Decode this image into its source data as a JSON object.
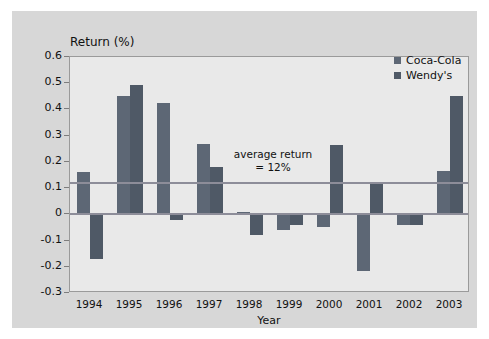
{
  "chart_data": {
    "type": "bar",
    "title": "",
    "ylabel": "Return (%)",
    "xlabel": "Year",
    "categories": [
      "1994",
      "1995",
      "1996",
      "1997",
      "1998",
      "1999",
      "2000",
      "2001",
      "2002",
      "2003"
    ],
    "ylim": [
      -0.3,
      0.6
    ],
    "ytick_labels": [
      "0.6",
      "0.5",
      "0.4",
      "0.3",
      "0.2",
      "0.1",
      "0",
      "-0.1",
      "-0.2",
      "-0.3"
    ],
    "ytick_values": [
      0.6,
      0.5,
      0.4,
      0.3,
      0.2,
      0.1,
      0,
      -0.1,
      -0.2,
      -0.3
    ],
    "grid": false,
    "legend_position": "top-right",
    "series": [
      {
        "name": "Coca-Cola",
        "color": "#5d6775",
        "values": [
          0.16,
          0.45,
          0.425,
          0.27,
          0.01,
          -0.06,
          -0.05,
          -0.215,
          -0.04,
          0.165
        ]
      },
      {
        "name": "Wendy's",
        "color": "#4f5966",
        "values": [
          -0.17,
          0.495,
          -0.02,
          0.18,
          -0.08,
          -0.04,
          0.265,
          0.12,
          -0.04,
          0.45
        ]
      }
    ],
    "annotations": [
      {
        "name": "average-return",
        "line1": "average return",
        "line2": "= 12%",
        "value": 0.12
      }
    ],
    "reference_line": {
      "label": "average return = 12%",
      "value": 0.12,
      "color": "#8d8d99"
    },
    "zero_line": {
      "value": 0,
      "color": "#8d8d99"
    }
  },
  "colors": {
    "page_background": "#ffffff",
    "panel_background": "#d7d7d7",
    "plot_background": "#e9e9e9",
    "axis": "#9a9a9a",
    "text": "#111111"
  }
}
